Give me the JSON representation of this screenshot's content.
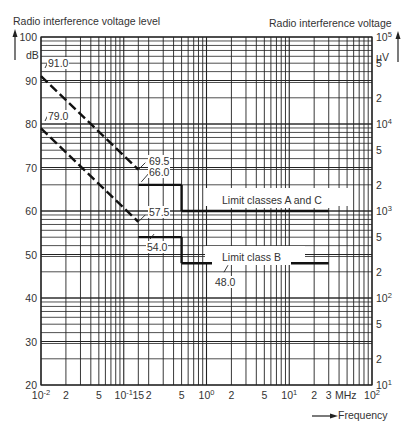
{
  "chart_data": {
    "type": "line",
    "title": "",
    "ylabel": "Radio interference voltage level",
    "ylabel_unit": "dB",
    "y2label": "Radio interference voltage",
    "y2label_unit": "µV",
    "xlabel": "Frequency",
    "xlabel_unit": "MHz",
    "xscale": "log",
    "xlim": [
      0.01,
      100
    ],
    "ylim": [
      20,
      100
    ],
    "grid": true,
    "x_ticks": [
      "10^-2",
      "2",
      "5",
      "10^-1",
      "15",
      "2",
      "5",
      "10^0",
      "2",
      "5",
      "10^1",
      "2",
      "3",
      "MHz",
      "10^2"
    ],
    "y_ticks": [
      "20",
      "30",
      "40",
      "50",
      "60",
      "70",
      "80",
      "90",
      "100"
    ],
    "y2_ticks": [
      "10^1",
      "2",
      "5",
      "10^2",
      "2",
      "5",
      "10^3",
      "2",
      "5",
      "10^4",
      "2",
      "5",
      "10^5"
    ],
    "series": [
      {
        "name": "Limit classes A and C",
        "points": [
          {
            "x": 0.01,
            "y": 91.0,
            "style": "dashed"
          },
          {
            "x": 0.15,
            "y": 69.5,
            "style": "dashed"
          },
          {
            "x": 0.15,
            "y": 66.0,
            "style": "solid"
          },
          {
            "x": 0.5,
            "y": 66.0,
            "style": "solid"
          },
          {
            "x": 0.5,
            "y": 60.0,
            "style": "solid"
          },
          {
            "x": 30,
            "y": 60.0,
            "style": "solid"
          }
        ]
      },
      {
        "name": "Limit class B",
        "points": [
          {
            "x": 0.01,
            "y": 79.0,
            "style": "dashed"
          },
          {
            "x": 0.15,
            "y": 57.5,
            "style": "dashed"
          },
          {
            "x": 0.15,
            "y": 54.0,
            "style": "solid"
          },
          {
            "x": 0.5,
            "y": 54.0,
            "style": "solid"
          },
          {
            "x": 0.5,
            "y": 48.0,
            "style": "solid"
          },
          {
            "x": 30,
            "y": 48.0,
            "style": "solid"
          }
        ]
      }
    ],
    "annotations": [
      "91.0",
      "79.0",
      "69.5",
      "66.0",
      "57.5",
      "54.0",
      "48.0",
      "Limit classes A and C",
      "Limit class B"
    ]
  },
  "labels": {
    "y_title": "Radio interference voltage level",
    "y2_title": "Radio interference voltage",
    "y_unit": "dB",
    "y2_unit": "µV",
    "x_title": "Frequency",
    "x_unit": "MHz",
    "curve_ac": "Limit classes A and C",
    "curve_b": "Limit class B",
    "a91": "91.0",
    "a79": "79.0",
    "a695": "69.5",
    "a66": "66.0",
    "a575": "57.5",
    "a54": "54.0",
    "a48": "48.0"
  }
}
